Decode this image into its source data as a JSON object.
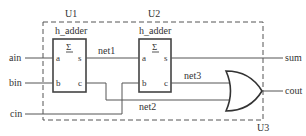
{
  "diagram": {
    "type": "logic-circuit",
    "container_label": "U3",
    "instances": [
      {
        "id": "U1",
        "type_name": "h_adder",
        "symbol": "Σ",
        "pins": {
          "in1": "a",
          "in2": "b",
          "out1": "s",
          "out2": "c"
        }
      },
      {
        "id": "U2",
        "type_name": "h_adder",
        "symbol": "Σ",
        "pins": {
          "in1": "a",
          "in2": "b",
          "out1": "s",
          "out2": "c"
        }
      }
    ],
    "gate": {
      "type": "OR"
    },
    "ports": {
      "inputs": [
        "ain",
        "bin",
        "cin"
      ],
      "outputs": [
        "sum",
        "cout"
      ]
    },
    "nets": [
      "net1",
      "net2",
      "net3"
    ]
  }
}
